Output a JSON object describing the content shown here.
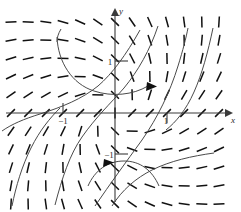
{
  "figure": {
    "kind": "direction-field",
    "width": 241,
    "height": 212,
    "background": "#ffffff",
    "ink_color": "#111111",
    "axis_color": "#3a3a3a",
    "curve_color": "#4a4a4a"
  },
  "axes": {
    "x_label": "x",
    "y_label": "y",
    "origin_px": [
      115,
      113
    ],
    "unit_px": 52,
    "x_range": [
      -2.25,
      2.25
    ],
    "y_range": [
      -1.9,
      2.15
    ],
    "x_ticks": [
      {
        "value": -1,
        "label": "−1",
        "px": 63
      },
      {
        "value": 1,
        "label": "1",
        "px": 167
      }
    ],
    "y_ticks": [
      {
        "value": 1,
        "label": "1",
        "px": 61
      },
      {
        "value": -1,
        "label": "−1",
        "px": 165
      }
    ],
    "grid": false,
    "arrows": [
      "x-positive",
      "y-positive"
    ]
  },
  "chart_data": {
    "type": "scatter",
    "title": "",
    "xlabel": "x",
    "ylabel": "y",
    "xlim": [
      -2.25,
      2.25
    ],
    "ylim": [
      -1.9,
      2.15
    ],
    "grid": false,
    "legend": "none",
    "slope_field": {
      "x_values": [
        -2.0,
        -1.67,
        -1.33,
        -1.0,
        -0.67,
        -0.33,
        0.0,
        0.33,
        0.67,
        1.0,
        1.33,
        1.67,
        2.0
      ],
      "y_values": [
        1.75,
        1.4,
        1.05,
        0.7,
        0.35,
        0.0,
        -0.35,
        -0.7,
        -1.05,
        -1.4,
        -1.75
      ],
      "slope_rule": "dy/dx = (x + y) / (x - y)",
      "dash_length_px": 11,
      "dash_count": 143
    },
    "solution_curves": [
      {
        "name": "upper-well-curve",
        "note": "U-shaped curve opening upward in the second/first quadrant, turning near (-0.4, 1.55)",
        "arrow_at": [
          0.52,
          1.22
        ],
        "arrow_direction": "right-down"
      },
      {
        "name": "left-separatrix-curve",
        "note": "Rising curve crossing the x-axis near x = -1.6 and flattening toward upper right",
        "arrow_at": null,
        "arrow_direction": null
      },
      {
        "name": "center-rising-curve",
        "note": "S-shaped curve passing near the origin and rising steeply to the upper right",
        "arrow_at": null,
        "arrow_direction": null
      },
      {
        "name": "right-steep-curve",
        "note": "Steeply rising curve crossing x-axis just right of x = 1",
        "arrow_at": null,
        "arrow_direction": null
      },
      {
        "name": "lower-left-falling-curve",
        "note": "Steep curve descending through the third quadrant",
        "arrow_at": null,
        "arrow_direction": null
      },
      {
        "name": "lower-dome-curve",
        "note": "Inverted-U curve opening downward below the origin, turning near (0.35, -1.45)",
        "arrow_at": [
          -0.15,
          -1.37
        ],
        "arrow_direction": "right-up"
      },
      {
        "name": "bottom-right-curve",
        "note": "Curve sweeping up from the lower middle toward the right of the x-axis",
        "arrow_at": null,
        "arrow_direction": null
      }
    ]
  }
}
